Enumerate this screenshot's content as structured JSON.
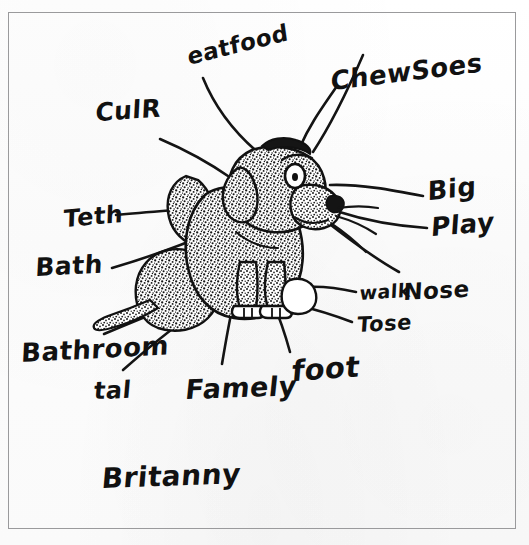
{
  "document": {
    "kind": "hand-drawn-labeled-diagram",
    "subject": "dog",
    "signature": "Britanny",
    "border_color": "#9a9a9c",
    "ink_color": "#111111",
    "paper_color": "#fdfdfd"
  },
  "labels": [
    {
      "id": "eat-food",
      "text": "eatfood",
      "x": 186,
      "y": 46,
      "size": 23,
      "rotate": -14,
      "skew": -6
    },
    {
      "id": "chew-socks",
      "text": "ChewSoes",
      "x": 331,
      "y": 68,
      "size": 26,
      "rotate": -7,
      "skew": -8
    },
    {
      "id": "color",
      "text": "CulR",
      "x": 96,
      "y": 100,
      "size": 25,
      "rotate": -4,
      "skew": -7
    },
    {
      "id": "big",
      "text": "Big",
      "x": 428,
      "y": 178,
      "size": 26,
      "rotate": -6,
      "skew": -7
    },
    {
      "id": "play",
      "text": "Play",
      "x": 432,
      "y": 214,
      "size": 26,
      "rotate": -5,
      "skew": -9
    },
    {
      "id": "teeth",
      "text": "Teth",
      "x": 64,
      "y": 207,
      "size": 24,
      "rotate": -5,
      "skew": -7
    },
    {
      "id": "bath",
      "text": "Bath",
      "x": 36,
      "y": 255,
      "size": 25,
      "rotate": -3,
      "skew": -6
    },
    {
      "id": "walk",
      "text": "walk",
      "x": 360,
      "y": 284,
      "size": 19,
      "rotate": -4,
      "skew": -7
    },
    {
      "id": "nose",
      "text": "Nose",
      "x": 404,
      "y": 281,
      "size": 23,
      "rotate": -3,
      "skew": -6
    },
    {
      "id": "toes",
      "text": "Tose",
      "x": 358,
      "y": 315,
      "size": 21,
      "rotate": -3,
      "skew": -7
    },
    {
      "id": "bathroom",
      "text": "Bathroom",
      "x": 22,
      "y": 340,
      "size": 26,
      "rotate": -3,
      "skew": -6
    },
    {
      "id": "tail",
      "text": "tal",
      "x": 95,
      "y": 379,
      "size": 24,
      "rotate": -2,
      "skew": -7
    },
    {
      "id": "family",
      "text": "Famely",
      "x": 187,
      "y": 376,
      "size": 27,
      "rotate": -2,
      "skew": -8
    },
    {
      "id": "foot",
      "text": "foot",
      "x": 293,
      "y": 357,
      "size": 29,
      "rotate": -4,
      "skew": -9
    },
    {
      "id": "signature",
      "text": "Britanny",
      "x": 103,
      "y": 465,
      "size": 28,
      "rotate": -2,
      "skew": -7
    }
  ]
}
